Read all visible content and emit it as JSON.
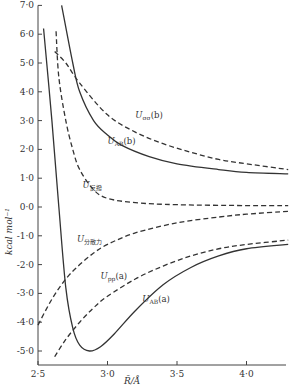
{
  "chart_data": {
    "type": "line",
    "title": "",
    "xlabel": "R̄/Å",
    "ylabel": "kcal mol⁻¹",
    "xlim": [
      2.5,
      4.3
    ],
    "ylim": [
      -5.5,
      7.0
    ],
    "grid": false,
    "x_ticks": [
      "2·5",
      "3·0",
      "3·5",
      "4·0"
    ],
    "y_ticks": [
      "7·0",
      "6·0",
      "5·0",
      "4·0",
      "3·0",
      "2·0",
      "1·0",
      "0·0",
      "-1·0",
      "-2·0",
      "-3·0",
      "-4·0",
      "-5·0"
    ],
    "series": [
      {
        "name": "U_AB(a)",
        "style": "solid",
        "label_main": "U",
        "label_sub": "AB",
        "label_tail": "(a)",
        "points": [
          [
            2.54,
            6.2
          ],
          [
            2.6,
            3.0
          ],
          [
            2.65,
            0.0
          ],
          [
            2.7,
            -2.8
          ],
          [
            2.75,
            -4.2
          ],
          [
            2.8,
            -4.8
          ],
          [
            2.87,
            -5.0
          ],
          [
            2.95,
            -4.85
          ],
          [
            3.05,
            -4.4
          ],
          [
            3.2,
            -3.6
          ],
          [
            3.4,
            -2.7
          ],
          [
            3.6,
            -2.1
          ],
          [
            3.8,
            -1.7
          ],
          [
            4.0,
            -1.45
          ],
          [
            4.3,
            -1.3
          ]
        ]
      },
      {
        "name": "U_AB(b)",
        "style": "solid",
        "label_main": "U",
        "label_sub": "AB",
        "label_tail": "(b)",
        "points": [
          [
            2.67,
            7.0
          ],
          [
            2.75,
            5.0
          ],
          [
            2.8,
            4.0
          ],
          [
            2.9,
            3.0
          ],
          [
            3.0,
            2.5
          ],
          [
            3.1,
            2.15
          ],
          [
            3.3,
            1.75
          ],
          [
            3.5,
            1.5
          ],
          [
            3.8,
            1.3
          ],
          [
            4.0,
            1.2
          ],
          [
            4.3,
            1.15
          ]
        ]
      },
      {
        "name": "U_σσ(b)",
        "style": "dashed",
        "label_main": "U",
        "label_sub": "σσ",
        "label_tail": "(b)",
        "points": [
          [
            2.62,
            5.4
          ],
          [
            2.7,
            5.0
          ],
          [
            2.8,
            4.3
          ],
          [
            3.0,
            3.2
          ],
          [
            3.2,
            2.6
          ],
          [
            3.4,
            2.2
          ],
          [
            3.6,
            1.9
          ],
          [
            3.8,
            1.65
          ],
          [
            4.0,
            1.5
          ],
          [
            4.3,
            1.3
          ]
        ]
      },
      {
        "name": "U_反撥",
        "style": "dashed",
        "label_main": "U",
        "label_sub": "反撥",
        "label_tail": "",
        "points": [
          [
            2.63,
            6.1
          ],
          [
            2.65,
            4.5
          ],
          [
            2.7,
            3.0
          ],
          [
            2.75,
            2.0
          ],
          [
            2.8,
            1.3
          ],
          [
            2.9,
            0.6
          ],
          [
            3.0,
            0.3
          ],
          [
            3.2,
            0.15
          ],
          [
            3.5,
            0.08
          ],
          [
            4.0,
            0.05
          ],
          [
            4.3,
            0.05
          ]
        ]
      },
      {
        "name": "U_分散力",
        "style": "dashed",
        "label_main": "U",
        "label_sub": "分散力",
        "label_tail": "",
        "points": [
          [
            2.5,
            -4.1
          ],
          [
            2.6,
            -3.2
          ],
          [
            2.7,
            -2.5
          ],
          [
            2.8,
            -2.0
          ],
          [
            2.9,
            -1.6
          ],
          [
            3.0,
            -1.3
          ],
          [
            3.2,
            -0.9
          ],
          [
            3.5,
            -0.55
          ],
          [
            3.8,
            -0.35
          ],
          [
            4.0,
            -0.25
          ],
          [
            4.3,
            -0.15
          ]
        ]
      },
      {
        "name": "U_pp(a)",
        "style": "dashed",
        "label_main": "U",
        "label_sub": "pp",
        "label_tail": "(a)",
        "points": [
          [
            2.62,
            -5.2
          ],
          [
            2.7,
            -4.6
          ],
          [
            2.8,
            -4.0
          ],
          [
            2.9,
            -3.5
          ],
          [
            3.0,
            -3.1
          ],
          [
            3.2,
            -2.5
          ],
          [
            3.4,
            -2.05
          ],
          [
            3.6,
            -1.7
          ],
          [
            3.8,
            -1.45
          ],
          [
            4.0,
            -1.3
          ],
          [
            4.3,
            -1.15
          ]
        ]
      }
    ],
    "annotations": [
      {
        "text": "U_σσ(b)",
        "at": [
          3.2,
          3.1
        ]
      },
      {
        "text": "U_AB(b)",
        "at": [
          3.0,
          2.2
        ]
      },
      {
        "text": "U_反撥",
        "at": [
          2.82,
          0.65
        ]
      },
      {
        "text": "U_分散力",
        "at": [
          2.78,
          -1.2
        ]
      },
      {
        "text": "U_pp(a)",
        "at": [
          2.95,
          -2.5
        ]
      },
      {
        "text": "U_AB(a)",
        "at": [
          3.25,
          -3.3
        ]
      }
    ]
  },
  "axes": {
    "y_label": "kcal mol⁻¹",
    "x_label": "R̄/Å"
  }
}
